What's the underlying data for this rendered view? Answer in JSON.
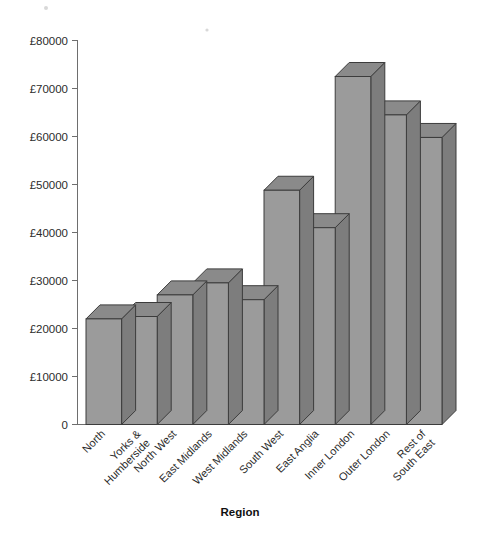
{
  "chart_data": {
    "type": "bar",
    "title": "",
    "subtitle": "",
    "xlabel": "Region",
    "ylabel": "",
    "categories": [
      "North",
      "Yorks & Humberside",
      "North West",
      "East Midlands",
      "West Midlands",
      "South West",
      "East Anglia",
      "Inner London",
      "Outer London",
      "Rest of South East"
    ],
    "values": [
      22000,
      22500,
      27000,
      29500,
      26000,
      48800,
      41000,
      72500,
      64500,
      59800
    ],
    "ylim": [
      0,
      80000
    ],
    "ytick_values": [
      0,
      10000,
      20000,
      30000,
      40000,
      50000,
      60000,
      70000,
      80000
    ],
    "ytick_labels": [
      "0",
      "£10000",
      "£20000",
      "£30000",
      "£40000",
      "£50000",
      "£60000",
      "£70000",
      "£80000"
    ],
    "currency_symbol": "£",
    "grid": false,
    "legend": false,
    "legend_position": "none",
    "style": "3d-bar",
    "bar_color": "#9b9b9b",
    "bar_top_color": "#8a8a8a",
    "bar_side_color": "#7d7d7d",
    "bar_edge_color": "#3c3c3c",
    "axis_color": "#6e6e6e",
    "background_color": "#ffffff"
  },
  "axis": {
    "x_title": "Region",
    "category_label_lines": [
      [
        "North"
      ],
      [
        "Yorks &",
        "Humberside"
      ],
      [
        "North West"
      ],
      [
        "East Midlands"
      ],
      [
        "West Midlands"
      ],
      [
        "South West"
      ],
      [
        "East Anglia"
      ],
      [
        "Inner London"
      ],
      [
        "Outer London"
      ],
      [
        "Rest of",
        "South East"
      ]
    ],
    "y_tick_labels": [
      "£80000",
      "£70000",
      "£60000",
      "£50000",
      "£40000",
      "£30000",
      "£20000",
      "£10000",
      "0"
    ]
  }
}
